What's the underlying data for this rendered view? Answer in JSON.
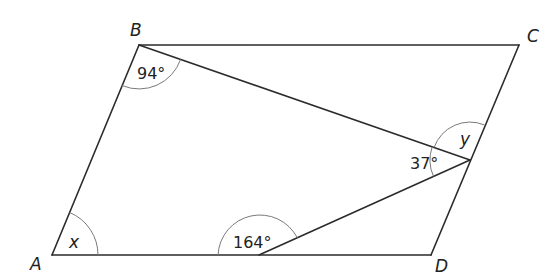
{
  "diagram": {
    "type": "parallelogram-with-triangles",
    "vertices": {
      "A": {
        "label": "A",
        "x": 52,
        "y": 255
      },
      "B": {
        "label": "B",
        "x": 139,
        "y": 45
      },
      "C": {
        "label": "C",
        "x": 519,
        "y": 45
      },
      "D": {
        "label": "D",
        "x": 431,
        "y": 255
      },
      "E": {
        "x": 470,
        "y": 160
      },
      "F": {
        "x": 259,
        "y": 255
      }
    },
    "angles": {
      "at_B": "94°",
      "at_E_lower": "37°",
      "at_E_upper": "y",
      "at_A": "x",
      "at_F": "164°"
    },
    "labels": {
      "A": "A",
      "B": "B",
      "C": "C",
      "D": "D"
    },
    "colors": {
      "line": "#2b2b2b",
      "arc": "#7a7a7a",
      "text": "#222222"
    }
  }
}
